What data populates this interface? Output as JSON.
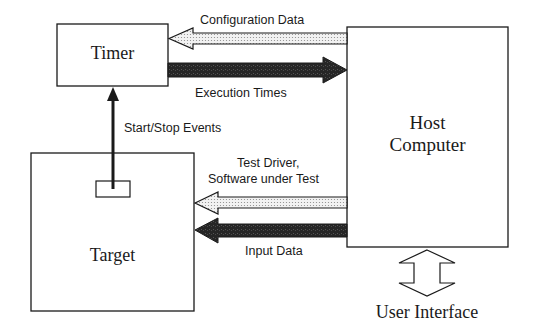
{
  "diagram": {
    "nodes": {
      "timer": {
        "label": "Timer"
      },
      "host": {
        "label_line1": "Host",
        "label_line2": "Computer"
      },
      "target": {
        "label": "Target"
      }
    },
    "edges": {
      "configuration_data": {
        "label": "Configuration Data",
        "direction": "host-to-timer",
        "style": "dotted-outline"
      },
      "execution_times": {
        "label": "Execution Times",
        "direction": "timer-to-host",
        "style": "dark-filled"
      },
      "start_stop_events": {
        "label": "Start/Stop Events",
        "direction": "target-to-timer",
        "style": "thin-line"
      },
      "test_driver": {
        "label_line1": "Test Driver,",
        "label_line2": "Software under Test",
        "direction": "host-to-target",
        "style": "dotted-outline"
      },
      "input_data": {
        "label": "Input Data",
        "direction": "host-to-target",
        "style": "dark-filled"
      },
      "user_interface": {
        "label": "User Interface",
        "direction": "bidirectional",
        "style": "outline"
      }
    },
    "colors": {
      "stroke": "#1a1a1a",
      "dark_fill": "#2b2b2b",
      "dotted_fill": "#e6e6e6",
      "background": "#ffffff"
    }
  }
}
